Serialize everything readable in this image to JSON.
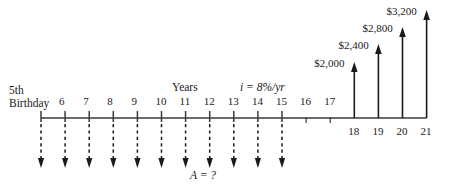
{
  "diagram": {
    "kind": "cash-flow-diagram",
    "title_labels": {
      "origin_line1": "5th",
      "origin_line2": "Birthday",
      "axis_caption": "Years",
      "interest_rate": "i = 8%/yr",
      "unknown_label": "A = ?"
    },
    "colors": {
      "line": "#3a3a3a",
      "arrow": "#1a1a1a",
      "text": "#1a1a1a",
      "background": "#ffffff"
    },
    "axis": {
      "start_year": 5,
      "end_year": 21,
      "baseline_y": 118,
      "x_start": 41,
      "spacing": 24.1,
      "tick_years": [
        5,
        6,
        7,
        8,
        9,
        10,
        11,
        12,
        13,
        14,
        15,
        16,
        17,
        18,
        19,
        20,
        21
      ]
    },
    "year_ticks": [
      {
        "year": 5,
        "label": "",
        "label_above": false,
        "tick_style": "long"
      },
      {
        "year": 6,
        "label": "6",
        "label_above": true,
        "tick_style": "long"
      },
      {
        "year": 7,
        "label": "7",
        "label_above": true,
        "tick_style": "long"
      },
      {
        "year": 8,
        "label": "8",
        "label_above": true,
        "tick_style": "long"
      },
      {
        "year": 9,
        "label": "9",
        "label_above": true,
        "tick_style": "long"
      },
      {
        "year": 10,
        "label": "10",
        "label_above": true,
        "tick_style": "long"
      },
      {
        "year": 11,
        "label": "11",
        "label_above": true,
        "tick_style": "long"
      },
      {
        "year": 12,
        "label": "12",
        "label_above": true,
        "tick_style": "long"
      },
      {
        "year": 13,
        "label": "13",
        "label_above": true,
        "tick_style": "long"
      },
      {
        "year": 14,
        "label": "14",
        "label_above": true,
        "tick_style": "long"
      },
      {
        "year": 15,
        "label": "15",
        "label_above": true,
        "tick_style": "long"
      },
      {
        "year": 16,
        "label": "16",
        "label_above": true,
        "tick_style": "short"
      },
      {
        "year": 17,
        "label": "17",
        "label_above": true,
        "tick_style": "short"
      },
      {
        "year": 18,
        "label": "18",
        "label_above": false,
        "tick_style": "none"
      },
      {
        "year": 19,
        "label": "19",
        "label_above": false,
        "tick_style": "none"
      },
      {
        "year": 20,
        "label": "20",
        "label_above": false,
        "tick_style": "none"
      },
      {
        "year": 21,
        "label": "21",
        "label_above": false,
        "tick_style": "none"
      }
    ],
    "cash_inflows": [
      {
        "year": 18,
        "amount": 2000,
        "amount_label": "$2,000",
        "arrow_top_y": 62
      },
      {
        "year": 19,
        "amount": 2400,
        "amount_label": "$2,400",
        "arrow_top_y": 44
      },
      {
        "year": 20,
        "amount": 2800,
        "amount_label": "$2,800",
        "arrow_top_y": 27
      },
      {
        "year": 21,
        "amount": 3200,
        "amount_label": "$3,200",
        "arrow_top_y": 10
      }
    ],
    "cash_outflows": {
      "label": "A = ?",
      "amount": null,
      "style": "dashed",
      "direction": "down",
      "arrow_bottom_y": 168,
      "years": [
        5,
        6,
        7,
        8,
        9,
        10,
        11,
        12,
        13,
        14,
        15
      ]
    }
  }
}
